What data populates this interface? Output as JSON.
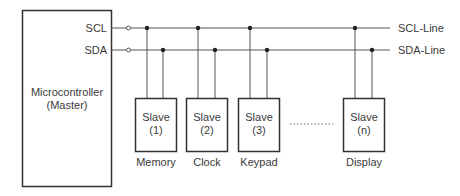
{
  "master": {
    "line1": "Microcontroller",
    "line2": "(Master)",
    "pins": {
      "scl": "SCL",
      "sda": "SDA"
    }
  },
  "bus": {
    "scl_label": "SCL-Line",
    "sda_label": "SDA-Line"
  },
  "slaves": [
    {
      "title": "Slave",
      "index": "(1)",
      "label": "Memory"
    },
    {
      "title": "Slave",
      "index": "(2)",
      "label": "Clock"
    },
    {
      "title": "Slave",
      "index": "(3)",
      "label": "Keypad"
    },
    {
      "title": "Slave",
      "index": "(n)",
      "label": "Display"
    }
  ],
  "colors": {
    "line": "#555555",
    "box_border": "#333333",
    "text": "#3a3a3a",
    "background": "#ffffff"
  }
}
